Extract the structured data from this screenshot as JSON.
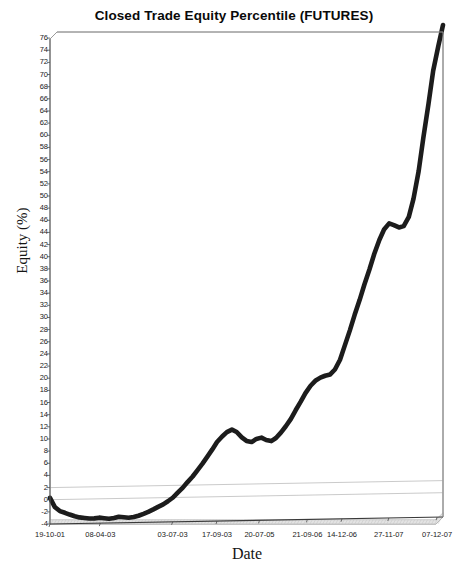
{
  "chart_data": {
    "type": "line",
    "title": "Closed Trade Equity Percentile (FUTURES)",
    "xlabel": "Date",
    "ylabel": "Equity (%)",
    "ylim": [
      -4,
      77
    ],
    "ytick_step": 2,
    "yticks": [
      76,
      74,
      72,
      70,
      68,
      66,
      64,
      62,
      60,
      58,
      56,
      54,
      52,
      50,
      48,
      46,
      44,
      42,
      40,
      38,
      36,
      34,
      32,
      30,
      28,
      26,
      24,
      22,
      20,
      18,
      16,
      14,
      12,
      10,
      8,
      6,
      4,
      2,
      0,
      -2,
      -4
    ],
    "xticks": [
      "19-10-01",
      "08-04-03",
      "03-07-03",
      "17-09-03",
      "20-07-05",
      "21-09-06",
      "14-12-06",
      "27-11-07",
      "07-12-07"
    ],
    "xtick_positions": [
      0.0,
      0.128,
      0.312,
      0.425,
      0.533,
      0.655,
      0.743,
      0.862,
      0.985
    ],
    "grid": "horizontal-light",
    "gridline_values": [
      0,
      2
    ],
    "legend": "none",
    "series": [
      {
        "name": "Closed Trade Equity Percentile",
        "color": "#1c1c1c",
        "x_fraction": [
          0.0,
          0.012,
          0.025,
          0.038,
          0.05,
          0.063,
          0.075,
          0.088,
          0.1,
          0.113,
          0.125,
          0.138,
          0.15,
          0.163,
          0.175,
          0.188,
          0.2,
          0.213,
          0.225,
          0.238,
          0.25,
          0.263,
          0.275,
          0.288,
          0.3,
          0.313,
          0.325,
          0.338,
          0.35,
          0.363,
          0.375,
          0.388,
          0.4,
          0.413,
          0.425,
          0.438,
          0.45,
          0.463,
          0.475,
          0.488,
          0.5,
          0.513,
          0.525,
          0.538,
          0.55,
          0.563,
          0.575,
          0.588,
          0.6,
          0.613,
          0.625,
          0.638,
          0.65,
          0.663,
          0.675,
          0.688,
          0.7,
          0.713,
          0.725,
          0.738,
          0.75,
          0.763,
          0.775,
          0.788,
          0.8,
          0.813,
          0.825,
          0.838,
          0.85,
          0.863,
          0.875,
          0.888,
          0.9,
          0.913,
          0.925,
          0.938,
          0.95,
          0.963,
          0.975,
          0.988,
          1.0
        ],
        "values": [
          0.3,
          -1.2,
          -1.9,
          -2.2,
          -2.5,
          -2.8,
          -3.0,
          -3.1,
          -3.2,
          -3.2,
          -3.1,
          -3.2,
          -3.3,
          -3.2,
          -3.0,
          -3.1,
          -3.2,
          -3.1,
          -2.9,
          -2.6,
          -2.3,
          -1.9,
          -1.5,
          -1.1,
          -0.6,
          0.0,
          0.8,
          1.6,
          2.5,
          3.4,
          4.4,
          5.5,
          6.6,
          7.8,
          9.0,
          9.9,
          10.6,
          11.0,
          10.6,
          9.7,
          9.1,
          8.9,
          9.4,
          9.6,
          9.2,
          9.0,
          9.5,
          10.4,
          11.4,
          12.6,
          14.0,
          15.4,
          16.8,
          18.0,
          18.8,
          19.3,
          19.6,
          19.8,
          20.6,
          22.2,
          24.5,
          27.0,
          29.5,
          32.0,
          34.5,
          37.0,
          39.5,
          41.8,
          43.5,
          44.5,
          44.2,
          43.8,
          44.0,
          45.5,
          48.5,
          53.0,
          58.5,
          64.0,
          69.5,
          73.5,
          77.0
        ]
      }
    ],
    "band": {
      "label": "lower-shaded-band",
      "from": -3.3,
      "to": -4
    }
  },
  "plot_geometry": {
    "left": 50,
    "right": 443,
    "top": 32,
    "bottom": 524
  }
}
